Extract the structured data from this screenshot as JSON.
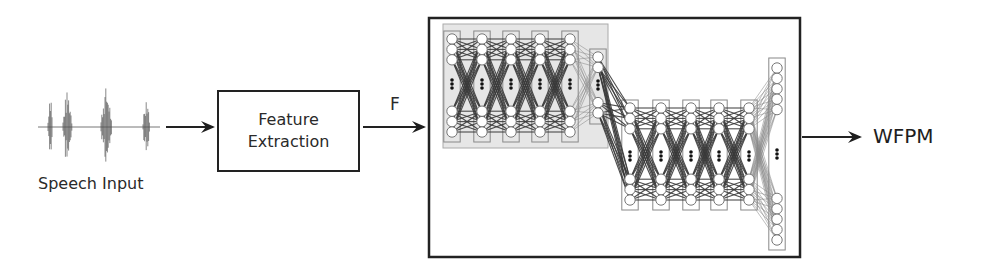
{
  "diagram": {
    "nodes": [
      {
        "id": "speech",
        "label": "Speech Input",
        "kind": "waveform"
      },
      {
        "id": "feature",
        "label_line1": "Feature",
        "label_line2": "Extraction",
        "kind": "box"
      },
      {
        "id": "dnn",
        "label": "",
        "kind": "neural-network-box"
      },
      {
        "id": "output",
        "label": "WFPM",
        "kind": "text"
      }
    ],
    "edges": [
      {
        "from": "speech",
        "to": "feature",
        "label": ""
      },
      {
        "from": "feature",
        "to": "dnn",
        "label": "F"
      },
      {
        "from": "dnn",
        "to": "output",
        "label": ""
      }
    ],
    "network": {
      "stage1_hidden_columns": 5,
      "stage1_bottleneck_columns": 1,
      "stage2_hidden_columns": 5,
      "stage2_output_columns": 1,
      "ellipsis_glyph": "⋮",
      "shaded_region_color": "#e3e3e3"
    }
  },
  "labels": {
    "speech_input": "Speech Input",
    "feature_line1": "Feature",
    "feature_line2": "Extraction",
    "f": "F",
    "wfpm": "WFPM"
  },
  "colors": {
    "stroke": "#222222",
    "node_stroke": "#777777",
    "edge_dark": "#444444",
    "edge_light": "#999999"
  }
}
